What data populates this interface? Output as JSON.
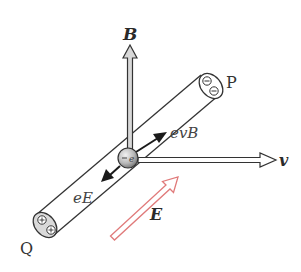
{
  "diagram": {
    "type": "physics-illustration",
    "labels": {
      "magnetic_field": "B",
      "velocity": "v",
      "electric_field": "E",
      "lorentz_force": "evB",
      "electric_force": "eE",
      "end_p": "P",
      "end_q": "Q"
    },
    "charges": {
      "end_p": [
        "−",
        "−"
      ],
      "end_q": [
        "+",
        "+"
      ],
      "electron": "−e"
    },
    "colors": {
      "stroke": "#333333",
      "vector_fill": "#d8d8d8",
      "force_arrow": "#1a1a1a",
      "field_arrow": "#e07a7a",
      "sphere": "#b0b0b0"
    }
  }
}
